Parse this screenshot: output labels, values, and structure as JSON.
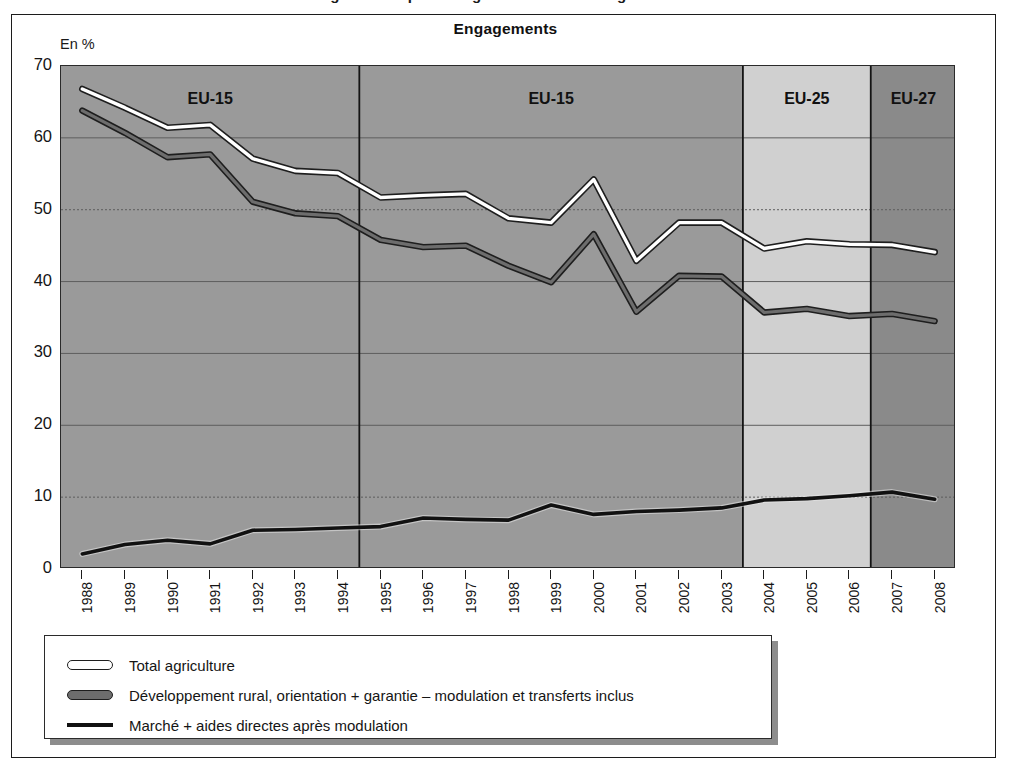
{
  "supertitle": "Figure 1 : Dépenses agricoles dans le budget de l'UE",
  "chart_title": "Engagements",
  "axis_unit": "En %",
  "bands": [
    {
      "label": "EU-15",
      "from": 1988,
      "to": 1994
    },
    {
      "label": "EU-15",
      "from": 1995,
      "to": 2003
    },
    {
      "label": "EU-25",
      "from": 2004,
      "to": 2006
    },
    {
      "label": "EU-27",
      "from": 2007,
      "to": 2008
    }
  ],
  "legend": [
    {
      "key": "total",
      "label": "Total agriculture",
      "swatch": "line-white-outlined"
    },
    {
      "key": "rural",
      "label": "Développement rural, orientation + garantie – modulation et transferts inclus",
      "swatch": "line-grey-outlined"
    },
    {
      "key": "market",
      "label": "Marché + aides directes après modulation",
      "swatch": "line-black"
    }
  ],
  "colors": {
    "band_eu15": "#9a9a9a",
    "band_eu25": "#d0d0d0",
    "band_eu27": "#8a8a8a",
    "line_total": "#ffffff",
    "line_rural": "#6d6d6d",
    "line_market": "#111111",
    "outline": "#1e1e1e",
    "grid": "#5d5d5d",
    "frame": "#1c1c1c"
  },
  "chart_data": {
    "type": "line",
    "title": "Engagements",
    "xlabel": "",
    "ylabel": "En %",
    "ylim": [
      0,
      70
    ],
    "yticks": [
      0,
      10,
      20,
      30,
      40,
      50,
      60,
      70
    ],
    "grid": true,
    "legend_position": "below",
    "x": [
      1988,
      1989,
      1990,
      1991,
      1992,
      1993,
      1994,
      1995,
      1996,
      1997,
      1998,
      1999,
      2000,
      2001,
      2002,
      2003,
      2004,
      2005,
      2006,
      2007,
      2008
    ],
    "categories": [
      "1988",
      "1989",
      "1990",
      "1991",
      "1992",
      "1993",
      "1994",
      "1995",
      "1996",
      "1997",
      "1998",
      "1999",
      "2000",
      "2001",
      "2002",
      "2003",
      "2004",
      "2005",
      "2006",
      "2007",
      "2008"
    ],
    "series": [
      {
        "name": "Total agriculture",
        "color": "#ffffff",
        "values": [
          66.8,
          64.2,
          61.4,
          61.8,
          57.1,
          55.4,
          55.1,
          51.7,
          52.0,
          52.2,
          48.8,
          48.2,
          54.2,
          42.9,
          48.2,
          48.2,
          44.6,
          45.6,
          45.2,
          45.1,
          44.1
        ]
      },
      {
        "name": "Développement rural, orientation + garantie – modulation et transferts inclus",
        "color": "#6d6d6d",
        "values": [
          63.8,
          60.7,
          57.3,
          57.7,
          51.1,
          49.5,
          49.1,
          45.8,
          44.8,
          45.0,
          42.2,
          39.9,
          46.6,
          35.8,
          40.8,
          40.7,
          35.7,
          36.2,
          35.2,
          35.5,
          34.5
        ]
      },
      {
        "name": "Marché + aides directes après modulation",
        "color": "#111111",
        "values": [
          2.1,
          3.4,
          4.0,
          3.5,
          5.4,
          5.5,
          5.7,
          5.9,
          7.1,
          6.9,
          6.8,
          8.9,
          7.6,
          8.0,
          8.2,
          8.5,
          9.6,
          9.8,
          10.2,
          10.7,
          9.7
        ]
      }
    ]
  }
}
